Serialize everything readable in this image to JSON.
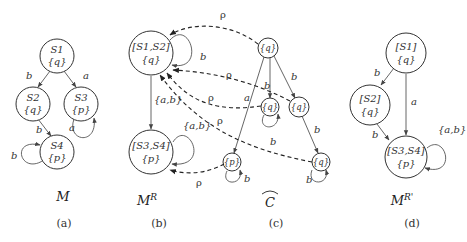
{
  "panels": {
    "a": {
      "title": "M",
      "caption": "(a)",
      "nodes": [
        {
          "id": "S1",
          "line1": "S1",
          "line2": "{q}"
        },
        {
          "id": "S2",
          "line1": "S2",
          "line2": "{q}"
        },
        {
          "id": "S3",
          "line1": "S3",
          "line2": "{p}"
        },
        {
          "id": "S4",
          "line1": "S4",
          "line2": "{p}"
        }
      ],
      "edges": [
        {
          "from": "S1",
          "to": "S2",
          "label": "b"
        },
        {
          "from": "S1",
          "to": "S3",
          "label": "a"
        },
        {
          "from": "S2",
          "to": "S4",
          "label": "b"
        },
        {
          "from": "S3",
          "to": "S3",
          "label": "a"
        },
        {
          "from": "S4",
          "to": "S4",
          "label": "b"
        }
      ]
    },
    "b": {
      "title": "M",
      "title_sup": "R",
      "caption": "(b)",
      "nodes": [
        {
          "id": "S1S2",
          "line1": "[S1,S2]",
          "line2": "{q}"
        },
        {
          "id": "S3S4",
          "line1": "[S3,S4]",
          "line2": "{p}"
        }
      ],
      "edges": [
        {
          "from": "S1S2",
          "to": "S1S2",
          "label": "b"
        },
        {
          "from": "S1S2",
          "to": "S3S4",
          "label": "{a,b}"
        },
        {
          "from": "S3S4",
          "to": "S3S4",
          "label": "{a,b}"
        }
      ]
    },
    "c": {
      "title": "C",
      "title_accent": "hat",
      "caption": "(c)",
      "nodes": [
        {
          "id": "c0",
          "line1": "{q}"
        },
        {
          "id": "c1",
          "line1": "{q}"
        },
        {
          "id": "c2",
          "line1": "{q}"
        },
        {
          "id": "c3",
          "line1": "{p}"
        },
        {
          "id": "c4",
          "line1": "{q}"
        }
      ],
      "edges": [
        {
          "from": "c0",
          "to": "c3",
          "label": "a"
        },
        {
          "from": "c0",
          "to": "c1",
          "label": "b"
        },
        {
          "from": "c0",
          "to": "c2",
          "label": "b"
        },
        {
          "from": "c2",
          "to": "c4",
          "label": "b"
        },
        {
          "from": "c1",
          "to": "c1",
          "label": "b"
        },
        {
          "from": "c3",
          "to": "c3",
          "label": "b"
        },
        {
          "from": "c4",
          "to": "c4",
          "label": "b"
        }
      ]
    },
    "d": {
      "title": "M",
      "title_sup": "R'",
      "caption": "(d)",
      "nodes": [
        {
          "id": "S1",
          "line1": "[S1]",
          "line2": "{q}"
        },
        {
          "id": "S2",
          "line1": "[S2]",
          "line2": "{q}"
        },
        {
          "id": "S3S4",
          "line1": "[S3,S4]",
          "line2": "{p}"
        }
      ],
      "edges": [
        {
          "from": "S1",
          "to": "S2",
          "label": "b"
        },
        {
          "from": "S1",
          "to": "S3S4",
          "label": "a"
        },
        {
          "from": "S2",
          "to": "S3S4",
          "label": "b"
        },
        {
          "from": "S3S4",
          "to": "S3S4",
          "label": "{a,b}"
        }
      ]
    }
  },
  "relation": {
    "label": "ρ",
    "links": [
      {
        "from": "c0",
        "to": "S1S2"
      },
      {
        "from": "c2",
        "to": "S1S2"
      },
      {
        "from": "c1",
        "to": "S1S2"
      },
      {
        "from": "c4",
        "to": "S1S2"
      },
      {
        "from": "c3",
        "to": "S3S4"
      }
    ]
  }
}
